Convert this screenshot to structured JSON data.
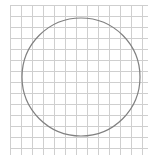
{
  "canvas": {
    "width": 154,
    "height": 165,
    "background": "#ffffff"
  },
  "grid": {
    "x_start": 10,
    "x_end": 148,
    "y_start": 5,
    "y_end": 155,
    "spacing": 11,
    "line_color": "#cfcfcf",
    "line_width": 1
  },
  "circle": {
    "cx": 81,
    "cy": 77,
    "r": 59,
    "stroke": "#808080",
    "stroke_width": 1.2,
    "fill": "none"
  }
}
